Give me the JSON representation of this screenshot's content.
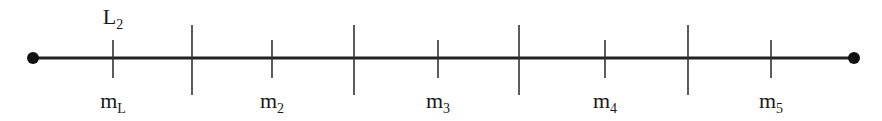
{
  "diagram": {
    "type": "number-line",
    "line": {
      "x_start": 33,
      "x_end": 854,
      "y": 58,
      "color": "#222222",
      "stroke_width": 3
    },
    "endpoints": [
      {
        "name": "left-endpoint",
        "x": 33,
        "y": 58,
        "radius": 6
      },
      {
        "name": "right-endpoint",
        "x": 854,
        "y": 58,
        "radius": 6
      }
    ],
    "boundary_ticks": [
      {
        "x": 192,
        "y1": 25,
        "y2": 95
      },
      {
        "x": 354,
        "y1": 25,
        "y2": 95
      },
      {
        "x": 519,
        "y1": 25,
        "y2": 95
      },
      {
        "x": 688,
        "y1": 25,
        "y2": 95
      }
    ],
    "midpoint_ticks": [
      {
        "x": 113,
        "y1": 40,
        "y2": 78,
        "label_main": "m",
        "label_sub": "L"
      },
      {
        "x": 272,
        "y1": 40,
        "y2": 78,
        "label_main": "m",
        "label_sub": "2"
      },
      {
        "x": 438,
        "y1": 40,
        "y2": 78,
        "label_main": "m",
        "label_sub": "3"
      },
      {
        "x": 605,
        "y1": 40,
        "y2": 78,
        "label_main": "m",
        "label_sub": "4"
      },
      {
        "x": 771,
        "y1": 40,
        "y2": 78,
        "label_main": "m",
        "label_sub": "5"
      }
    ],
    "top_label": {
      "x": 113,
      "main": "L",
      "sub": "2"
    },
    "colors": {
      "line": "#222222",
      "ticks": "#333333",
      "endpoints": "#111111",
      "text": "#1a1a1a"
    }
  }
}
